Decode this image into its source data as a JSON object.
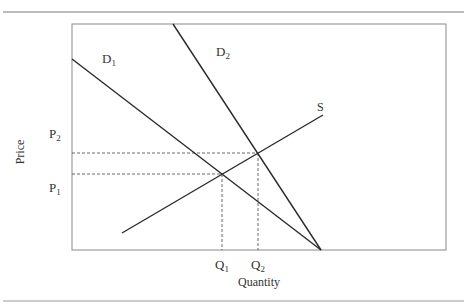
{
  "diagram": {
    "type": "supply-demand",
    "y_axis_label": "Price",
    "x_axis_label": "Quantity",
    "curves": [
      {
        "id": "D1",
        "label": "D",
        "sub": "1",
        "from": [
          72,
          59
        ],
        "to": [
          321,
          250
        ]
      },
      {
        "id": "D2",
        "label": "D",
        "sub": "2",
        "from": [
          173,
          24
        ],
        "to": [
          321,
          250
        ]
      },
      {
        "id": "S",
        "label": "S",
        "sub": "",
        "from": [
          122,
          233
        ],
        "to": [
          323,
          115
        ]
      }
    ],
    "price_levels": [
      {
        "label": "P",
        "sub": "2",
        "y": 153
      },
      {
        "label": "P",
        "sub": "1",
        "y": 174
      }
    ],
    "quantity_levels": [
      {
        "label": "Q",
        "sub": "1",
        "x": 222
      },
      {
        "label": "Q",
        "sub": "2",
        "x": 258
      }
    ],
    "equilibria": [
      {
        "name": "E1",
        "x": 222,
        "y": 174,
        "curves": [
          "D1",
          "S"
        ]
      },
      {
        "name": "E2",
        "x": 258,
        "y": 153,
        "curves": [
          "D2",
          "S"
        ]
      }
    ],
    "colors": {
      "curve": "#2b2b2b",
      "frame": "#8a8a8a",
      "rule": "#7a7a7a",
      "dashed": "#444444"
    }
  },
  "labels": {
    "d1": {
      "main": "D",
      "sub": "1"
    },
    "d2": {
      "main": "D",
      "sub": "2"
    },
    "s": {
      "main": "S"
    },
    "p1": {
      "main": "P",
      "sub": "1"
    },
    "p2": {
      "main": "P",
      "sub": "2"
    },
    "q1": {
      "main": "Q",
      "sub": "1"
    },
    "q2": {
      "main": "Q",
      "sub": "2"
    },
    "price": "Price",
    "quantity": "Quantity"
  }
}
